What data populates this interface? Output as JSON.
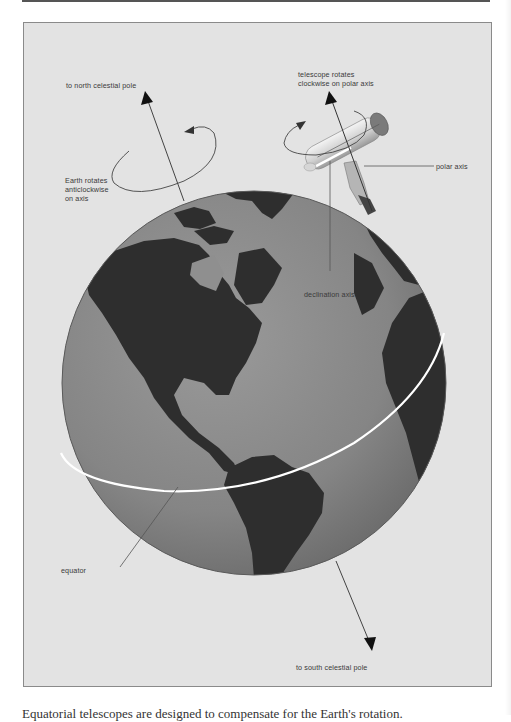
{
  "figure": {
    "labels": {
      "north_pole": "to north celestial pole",
      "telescope_rotation_line1": "telescope rotates",
      "telescope_rotation_line2": "clockwise on polar axis",
      "polar_axis": "polar axis",
      "earth_rotation_line1": "Earth rotates",
      "earth_rotation_line2": "anticlockwise",
      "earth_rotation_line3": "on axis",
      "declination_axis": "declination axis",
      "equator": "equator",
      "south_pole": "to south celestial pole"
    },
    "colors": {
      "background": "#e3e3e3",
      "ocean": "#8c8c8c",
      "land": "#2e2e2e",
      "equator_line": "#ffffff",
      "leader_line": "#555555"
    }
  },
  "caption": "Equatorial telescopes are designed to compensate for the Earth's rotation."
}
